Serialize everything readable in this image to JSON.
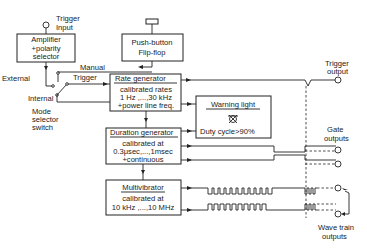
{
  "diagram": {
    "blocks": {
      "amplifier": {
        "line1": "Amplifier",
        "line2": "+polarity",
        "line3": "selector"
      },
      "pushbutton": {
        "line1": "Push-button",
        "line2": "Flip-flop"
      },
      "rate": {
        "title": "Rate generator",
        "line1": "calibrated rates",
        "line2": "1 Hz ,...,30 kHz",
        "line3": "+power line freq."
      },
      "duration": {
        "title": "Duration generator",
        "line1": "calibrated at",
        "line2": "0.3μsec,...,1msec",
        "line3": "+continuous"
      },
      "multivibrator": {
        "title": "Multivibrator",
        "line1": "calibrated at",
        "line2": "10 kHz ,...,10 MHz"
      },
      "warning": {
        "title": "Warning light",
        "line1": "Duty  cycle>90%"
      }
    },
    "labels": {
      "trigger_input_1": "Trigger",
      "trigger_input_2": "Input",
      "manual": "Manual",
      "external": "External",
      "internal": "Internal",
      "trigger": "Trigger",
      "mode_1": "Mode",
      "mode_2": "selector",
      "mode_3": "switch",
      "trigger_output_1": "Trigger",
      "trigger_output_2": "output",
      "gate_outputs_1": "Gate",
      "gate_outputs_2": "outputs",
      "wave_train_1": "Wave train",
      "wave_train_2": "outputs"
    },
    "icons": {
      "warning_lamp": "lamp-icon"
    }
  }
}
